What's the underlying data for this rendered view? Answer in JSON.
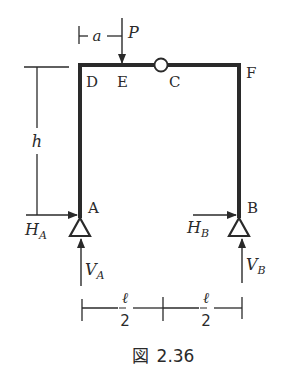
{
  "figure": {
    "caption_prefix": "図",
    "caption_number": "2.36",
    "colors": {
      "ink": "#2a2a2a",
      "background": "#ffffff"
    }
  },
  "points": {
    "A": "A",
    "B": "B",
    "C": "C",
    "D": "D",
    "E": "E",
    "F": "F"
  },
  "loads": {
    "P": "P",
    "a": "a"
  },
  "reactions": {
    "HA_main": "H",
    "HA_sub": "A",
    "HB_main": "H",
    "HB_sub": "B",
    "VA_main": "V",
    "VA_sub": "A",
    "VB_main": "V",
    "VB_sub": "B"
  },
  "dimensions": {
    "height": "h",
    "half_span_num_left": "ℓ",
    "half_span_den_left": "2",
    "half_span_num_right": "ℓ",
    "half_span_den_right": "2"
  },
  "elements": {
    "hinge_C": "internal-hinge",
    "support_A": "pin-support",
    "support_B": "pin-support"
  }
}
